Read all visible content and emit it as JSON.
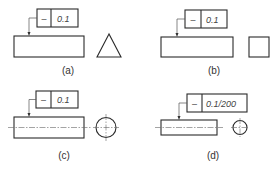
{
  "figures": [
    {
      "id": "a",
      "caption": "(a)",
      "tolerance_symbol": "–",
      "tolerance_symbol_name": "straightness",
      "tolerance_value": "0.1",
      "side_view_shape": "triangle"
    },
    {
      "id": "b",
      "caption": "(b)",
      "tolerance_symbol": "–",
      "tolerance_symbol_name": "straightness",
      "tolerance_value": "0.1",
      "side_view_shape": "square"
    },
    {
      "id": "c",
      "caption": "(c)",
      "tolerance_symbol": "–",
      "tolerance_symbol_name": "straightness",
      "tolerance_value": "0.1",
      "side_view_shape": "circle"
    },
    {
      "id": "d",
      "caption": "(d)",
      "tolerance_symbol": "–",
      "tolerance_symbol_name": "straightness",
      "tolerance_value": "0.1/200",
      "side_view_shape": "circle"
    }
  ],
  "colors": {
    "line": "#2a2a2a",
    "text": "#444444",
    "background": "#ffffff"
  }
}
